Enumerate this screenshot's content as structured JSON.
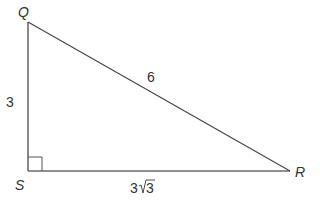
{
  "diagram": {
    "type": "right-triangle",
    "vertices": {
      "Q": {
        "label": "Q",
        "x": 28,
        "y": 22
      },
      "S": {
        "label": "S",
        "x": 28,
        "y": 171
      },
      "R": {
        "label": "R",
        "x": 290,
        "y": 171
      }
    },
    "sides": {
      "QS": {
        "label": "3"
      },
      "QR": {
        "label": "6"
      },
      "SR": {
        "coef": "3",
        "radicand": "3"
      }
    },
    "right_angle_at": "S",
    "colors": {
      "line": "#555555",
      "text": "#333333",
      "background": "#ffffff"
    }
  }
}
